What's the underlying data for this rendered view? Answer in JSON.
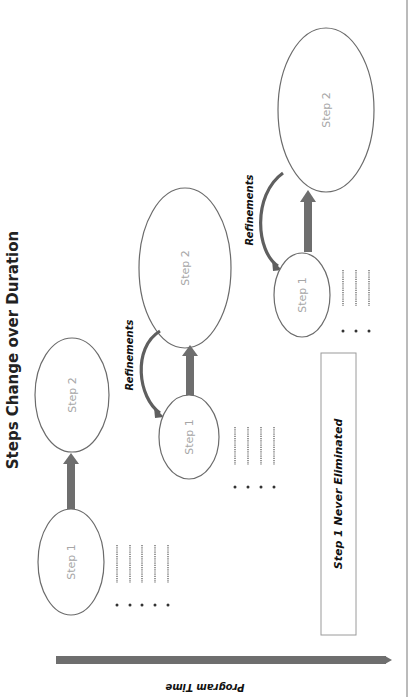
{
  "diagram": {
    "title": "Steps Change over Duration",
    "orientation": "page rotated 90 degrees counter-clockwise",
    "colors": {
      "ellipse_stroke": "#6b6b6b",
      "step_label": "#a6a6a6",
      "arrow": "#6e6e6e",
      "text": "#111111"
    },
    "stages": [
      {
        "name": "stage-1",
        "step1_label": "Step 1",
        "step2_label": "Step 2",
        "list_items": 5
      },
      {
        "name": "stage-2",
        "step1_label": "Step 1",
        "step2_label": "Step 2",
        "refinements_label": "Refinements",
        "list_items": 4
      },
      {
        "name": "stage-3",
        "step1_label": "Step 1",
        "step2_label": "Step 2",
        "refinements_label": "Refinements",
        "list_items": 3
      }
    ],
    "note_box": {
      "label": "Step 1 Never Eliminated"
    },
    "timeline": {
      "label": "Program Time"
    }
  }
}
